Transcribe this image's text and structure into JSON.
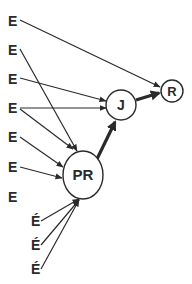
{
  "diagram": {
    "nodes": [
      {
        "id": "E1",
        "label": "E",
        "x": 12,
        "y": 21
      },
      {
        "id": "E2",
        "label": "E",
        "x": 12,
        "y": 50
      },
      {
        "id": "E3",
        "label": "E",
        "x": 12,
        "y": 79
      },
      {
        "id": "E4",
        "label": "E",
        "x": 12,
        "y": 108
      },
      {
        "id": "E5",
        "label": "E",
        "x": 12,
        "y": 137
      },
      {
        "id": "E6",
        "label": "E",
        "x": 12,
        "y": 167
      },
      {
        "id": "E7",
        "label": "E",
        "x": 12,
        "y": 197
      },
      {
        "id": "Ea1",
        "label": "É",
        "x": 37,
        "y": 221
      },
      {
        "id": "Ea2",
        "label": "É",
        "x": 37,
        "y": 245
      },
      {
        "id": "Ea3",
        "label": "É",
        "x": 37,
        "y": 269
      },
      {
        "id": "PR",
        "label": "PR",
        "shape": "ellipse",
        "x": 83,
        "y": 175
      },
      {
        "id": "J",
        "label": "J",
        "shape": "circle",
        "x": 121,
        "y": 105
      },
      {
        "id": "R",
        "label": "R",
        "shape": "circle",
        "x": 172,
        "y": 91
      }
    ],
    "edges": [
      {
        "from": "E1",
        "to": "R",
        "weight": "thin"
      },
      {
        "from": "E2",
        "to": "PR",
        "weight": "thin"
      },
      {
        "from": "E3",
        "to": "J",
        "weight": "thin"
      },
      {
        "from": "E4",
        "to": "J",
        "weight": "thin"
      },
      {
        "from": "E4",
        "to": "PR",
        "weight": "thin"
      },
      {
        "from": "E5",
        "to": "PR",
        "weight": "thin"
      },
      {
        "from": "E6",
        "to": "PR",
        "weight": "thin"
      },
      {
        "from": "Ea1",
        "to": "PR",
        "weight": "thin"
      },
      {
        "from": "Ea2",
        "to": "PR",
        "weight": "thin"
      },
      {
        "from": "Ea3",
        "to": "PR",
        "weight": "thin"
      },
      {
        "from": "PR",
        "to": "J",
        "weight": "thick"
      },
      {
        "from": "J",
        "to": "R",
        "weight": "thick"
      }
    ]
  },
  "labels": {
    "e1": "E",
    "e2": "E",
    "e3": "E",
    "e4": "E",
    "e5": "E",
    "e6": "E",
    "e7": "E",
    "ea1": "É",
    "ea2": "É",
    "ea3": "É",
    "pr": "PR",
    "j": "J",
    "r": "R"
  },
  "colors": {
    "stroke": "#2a2a2a",
    "background": "#ffffff"
  }
}
